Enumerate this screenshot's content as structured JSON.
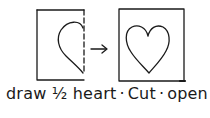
{
  "diagram": {
    "steps": [
      {
        "label": "draw 1/2 heart",
        "panel": "left",
        "description": "Folded paper with half heart drawn along dashed fold"
      },
      {
        "label": "Cut",
        "panel": "arrow"
      },
      {
        "label": "open",
        "panel": "right",
        "description": "Opened paper showing full heart"
      }
    ],
    "caption": {
      "draw": "draw",
      "half": "½",
      "heart": "heart",
      "sep1": "·",
      "cut": "Cut",
      "sep2": "·",
      "open": "open"
    },
    "colors": {
      "ink": "#1a1a1a",
      "paper": "#ffffff"
    },
    "icons": [
      "folded-paper-icon",
      "half-heart-icon",
      "arrow-right-icon",
      "paper-icon",
      "heart-icon"
    ]
  }
}
